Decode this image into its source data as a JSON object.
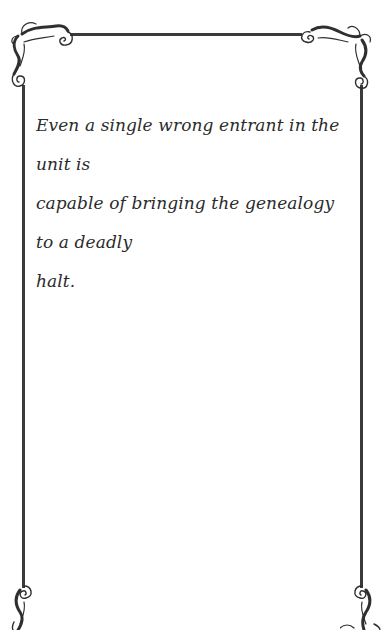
{
  "card": {
    "quote_lines": [
      "Even a single wrong entrant in the unit is",
      "capable of bringing the genealogy to a deadly",
      "halt."
    ],
    "quote_text": "Even a single wrong entrant in the unit is capable of bringing the genealogy to a deadly halt.",
    "frame": {
      "line_color": "#3a3a3a",
      "background_color": "#ffffff",
      "corner_style": "flourish-scroll-ornament"
    },
    "icons": {
      "top_left": "flourish-corner-icon",
      "top_right": "flourish-corner-icon",
      "bottom_left": "flourish-corner-icon",
      "bottom_right": "flourish-corner-icon"
    }
  }
}
